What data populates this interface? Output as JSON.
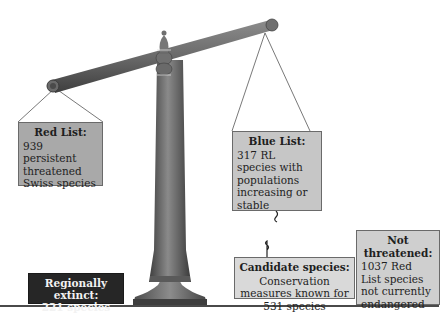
{
  "figure": {
    "type": "balance-scale-diagram",
    "colors": {
      "red_list_box": "#a9a9a9",
      "blue_list_box": "#c6c6c6",
      "candidate_box": "#d9d9d9",
      "not_threatened_box": "#cfcfcf",
      "regionally_extinct_box": "#262626",
      "scale_metal": "#6e6e6e",
      "ground_line": "#4a4a4a"
    }
  },
  "red_list": {
    "title": "Red List:",
    "body": "939 persistent threatened Swiss species",
    "count": 939
  },
  "blue_list": {
    "title": "Blue List:",
    "body": "317 RL species with populations increasing or stable",
    "count": 317
  },
  "candidate_species": {
    "title": "Candidate species:",
    "body": "Conservation measures known for 531 species",
    "count": 531
  },
  "not_threatened": {
    "title": "Not threatened:",
    "body": "1037 Red List species not currently endangered",
    "count": 1037
  },
  "regionally_extinct": {
    "title": "Regionally extinct:",
    "body": "221 species",
    "count": 221
  },
  "icons": {
    "scale": "balance-scale-icon",
    "hook": "hook-icon"
  }
}
